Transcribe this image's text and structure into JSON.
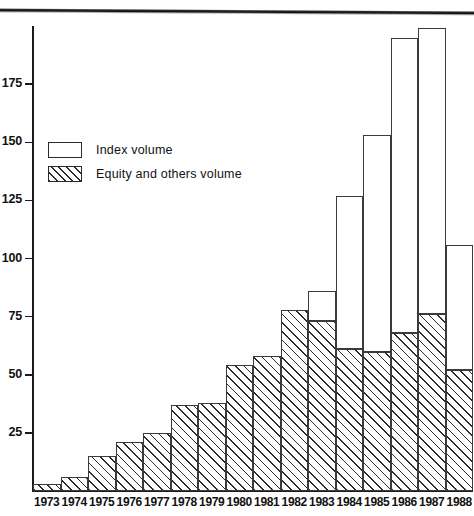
{
  "chart_data": {
    "type": "bar",
    "title": "",
    "subtitle": "",
    "xlabel": "",
    "ylabel": "",
    "stacked": true,
    "grid": false,
    "legend_position": "upper-left-inside",
    "ylim": [
      0,
      200
    ],
    "yticks": [
      25,
      50,
      75,
      100,
      125,
      150,
      175
    ],
    "ytick_labels": [
      "25",
      "50",
      "75",
      "100",
      "125",
      "150",
      "175"
    ],
    "categories": [
      "1973",
      "1974",
      "1975",
      "1976",
      "1977",
      "1978",
      "1979",
      "1980",
      "1981",
      "1982",
      "1983",
      "1984",
      "1985",
      "1986",
      "1987",
      "1988"
    ],
    "series": [
      {
        "name": "Equity and others volume",
        "fill": "hatched",
        "values": [
          3,
          6,
          15,
          21,
          25,
          37,
          38,
          54,
          58,
          78,
          73,
          61,
          60,
          68,
          76,
          52
        ]
      },
      {
        "name": "Index volume",
        "fill": "white",
        "values": [
          0,
          0,
          0,
          0,
          0,
          0,
          0,
          0,
          0,
          0,
          13,
          66,
          93,
          127,
          123,
          54
        ]
      }
    ],
    "totals": [
      3,
      6,
      15,
      21,
      25,
      37,
      38,
      54,
      58,
      78,
      86,
      127,
      153,
      195,
      199,
      106
    ]
  },
  "legend": {
    "items": [
      {
        "label": "Index volume",
        "fill": "white"
      },
      {
        "label": "Equity and others volume",
        "fill": "hatched"
      }
    ]
  },
  "colors": {
    "axis": "#1b1b1b",
    "bar_outline": "#3a3a3a",
    "hatch": "#2b2b2b",
    "background": "#ffffff"
  }
}
